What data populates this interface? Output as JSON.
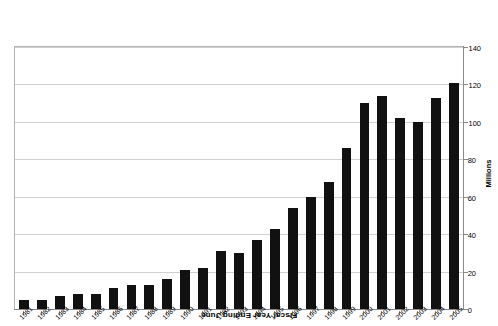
{
  "chart_data": {
    "type": "bar",
    "title": "Fiscal Year Ending June",
    "xlabel": "Fiscal Year Ending June",
    "ylabel": "Millions",
    "orientation": "inverted-180",
    "ylim": [
      0,
      140
    ],
    "y_ticks": [
      0,
      20,
      40,
      60,
      80,
      100,
      120,
      140
    ],
    "y_tick_labels": [
      "0",
      "20",
      "40",
      "60",
      "80",
      "100",
      "120",
      "140"
    ],
    "grid": true,
    "legend": "none",
    "bar_color": "#111111",
    "categories": [
      "2005",
      "2004",
      "2003",
      "2002",
      "2001",
      "2000",
      "1999",
      "1998",
      "1997",
      "1996",
      "1995",
      "1994",
      "1993",
      "1992",
      "1991",
      "1990",
      "1989",
      "1988",
      "1987",
      "1986",
      "1985",
      "1984",
      "1983",
      "1982",
      "1981"
    ],
    "values": [
      121,
      113,
      100,
      102,
      114,
      110,
      86,
      68,
      60,
      54,
      43,
      37,
      30,
      31,
      22,
      21,
      16,
      13,
      13,
      11,
      8,
      8,
      7,
      5,
      5
    ]
  },
  "axes": {
    "y_title": "Millions",
    "x_title": "Fiscal Year Ending June"
  }
}
